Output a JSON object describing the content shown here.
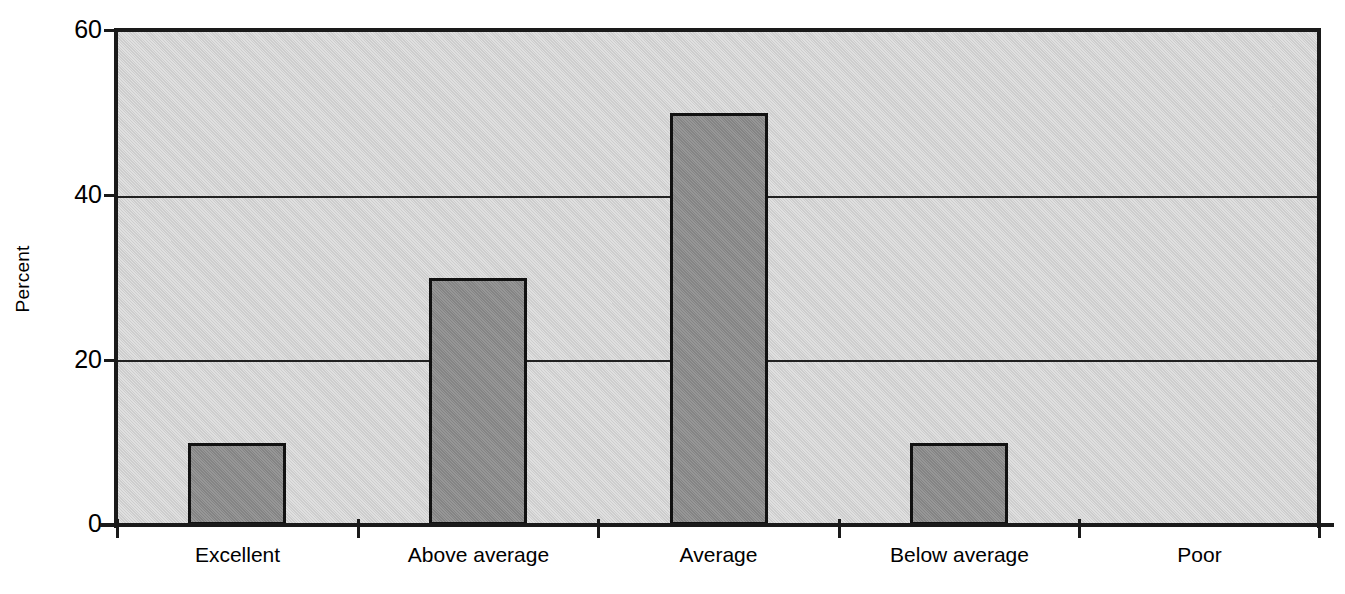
{
  "chart_data": {
    "type": "bar",
    "title": "",
    "subtitle": "",
    "xlabel": "",
    "ylabel": "Percent",
    "categories": [
      "Excellent",
      "Above average",
      "Average",
      "Below average",
      "Poor"
    ],
    "values": [
      10,
      30,
      50,
      10,
      0
    ],
    "ylim": [
      0,
      60
    ],
    "yticks": [
      0,
      20,
      40,
      60
    ],
    "ytick_labels": [
      "0",
      "20",
      "40",
      "60"
    ],
    "gridlines": [
      20,
      40
    ],
    "grid": true,
    "legend": null,
    "annotations": [],
    "colors": {
      "bar_fill": "#8b8b8b",
      "bar_outline": "#111111",
      "plot_background": "#d2d2d2",
      "page_background": "#ffffff",
      "axis": "#1a1a1a",
      "gridline": "#222222",
      "text": "#000000"
    }
  },
  "axes": {
    "y": {
      "label": "Percent",
      "ticks": [
        {
          "value": 60,
          "text": "60"
        },
        {
          "value": 40,
          "text": "40"
        },
        {
          "value": 20,
          "text": "20"
        },
        {
          "value": 0,
          "text": "0"
        }
      ]
    },
    "x": {
      "label": "",
      "ticks": [
        {
          "text": "Excellent"
        },
        {
          "text": "Above average"
        },
        {
          "text": "Average"
        },
        {
          "text": "Below average"
        },
        {
          "text": "Poor"
        }
      ]
    }
  }
}
